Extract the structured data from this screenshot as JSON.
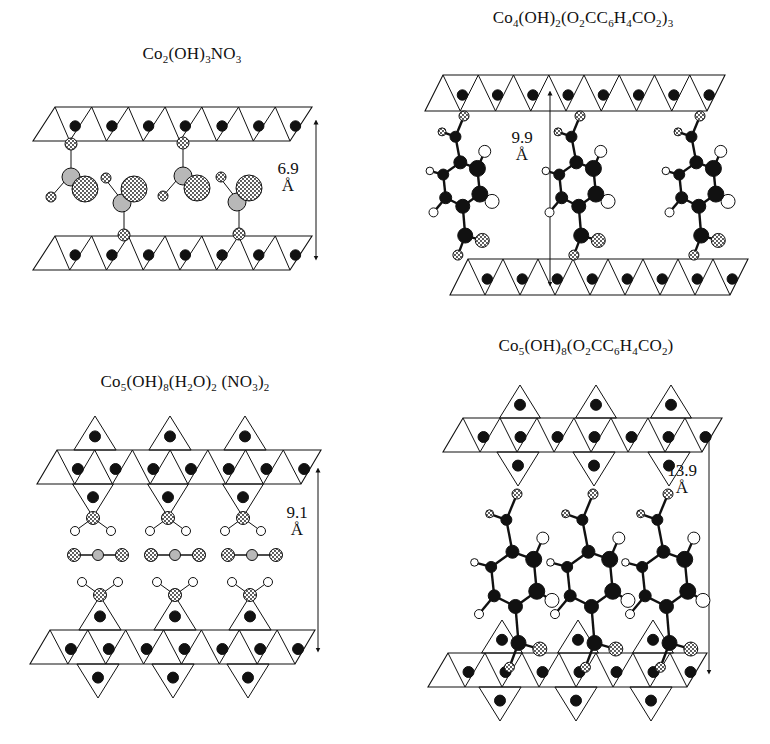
{
  "figure": {
    "panels": [
      {
        "id": "p1",
        "title_parts": [
          [
            "Co",
            ""
          ],
          [
            "2",
            "sub"
          ],
          [
            "(OH)",
            ""
          ],
          [
            "3",
            "sub"
          ],
          [
            "NO",
            ""
          ],
          [
            "3",
            "sub"
          ]
        ],
        "title_text": "Co2(OH)3NO3",
        "title_pos": [
          192,
          58
        ],
        "distance": "6.9",
        "unit": "Å",
        "dist_pos": [
          288,
          168
        ],
        "arrow": {
          "x": 316,
          "y1": 122,
          "y2": 258
        },
        "layer_type": "brucite",
        "layers": [
          {
            "top": 107,
            "bot": 141,
            "xl_top": 55,
            "xr_top": 312,
            "xl_bot": 33,
            "xr_bot": 290,
            "n": 7
          },
          {
            "top": 236,
            "bot": 270,
            "xl_top": 55,
            "xr_top": 312,
            "xl_bot": 33,
            "xr_bot": 290,
            "n": 7
          }
        ],
        "guest": "nitrate-grafted"
      },
      {
        "id": "p2",
        "title_parts": [
          [
            "Co",
            ""
          ],
          [
            "4",
            "sub"
          ],
          [
            "(OH)",
            ""
          ],
          [
            "2",
            "sub"
          ],
          [
            "(O",
            ""
          ],
          [
            "2",
            "sub"
          ],
          [
            "CC",
            ""
          ],
          [
            "6",
            "sub"
          ],
          [
            "H",
            ""
          ],
          [
            "4",
            "sub"
          ],
          [
            "CO",
            ""
          ],
          [
            "2",
            "sub"
          ],
          [
            ")",
            ""
          ],
          [
            "3",
            "sub"
          ]
        ],
        "title_text": "Co4(OH)2(O2CC6H4CO2)3",
        "title_pos": [
          583,
          22
        ],
        "distance": "9.9",
        "unit": "Å",
        "dist_pos": [
          522,
          137
        ],
        "arrow": {
          "x": 550,
          "y1": 93,
          "y2": 284
        },
        "layer_type": "brucite",
        "layers": [
          {
            "top": 75,
            "bot": 111,
            "xl_top": 443,
            "xr_top": 725,
            "xl_bot": 425,
            "xr_bot": 707,
            "n": 8
          },
          {
            "top": 259,
            "bot": 295,
            "xl_top": 468,
            "xr_top": 748,
            "xl_bot": 450,
            "xr_bot": 730,
            "n": 8
          }
        ],
        "guest": "terephthalate-grafted"
      },
      {
        "id": "p3",
        "title_parts": [
          [
            "Co",
            ""
          ],
          [
            "5",
            "sub"
          ],
          [
            "(OH)",
            ""
          ],
          [
            "8",
            "sub"
          ],
          [
            "(H",
            ""
          ],
          [
            "2",
            "sub"
          ],
          [
            "O)",
            ""
          ],
          [
            "2",
            "sub"
          ],
          [
            " (NO",
            ""
          ],
          [
            "3",
            "sub"
          ],
          [
            ")",
            ""
          ],
          [
            "2",
            "sub"
          ]
        ],
        "title_text": "Co5(OH)8(H2O)2 (NO3)2",
        "title_pos": [
          185,
          386
        ],
        "distance": "9.1",
        "unit": "Å",
        "dist_pos": [
          297,
          512
        ],
        "arrow": {
          "x": 318,
          "y1": 470,
          "y2": 650
        },
        "layer_type": "tetra-decorated",
        "layers": [
          {
            "top": 450,
            "bot": 484,
            "xl_top": 57,
            "xr_top": 321,
            "xl_bot": 37,
            "xr_bot": 301,
            "n": 7,
            "up_apex": 416,
            "down_apex": 517,
            "tet_x": [
              95,
              170,
              245
            ]
          },
          {
            "top": 630,
            "bot": 664,
            "xl_top": 50,
            "xr_top": 315,
            "xl_bot": 30,
            "xr_bot": 295,
            "n": 7,
            "up_apex": 596,
            "down_apex": 698,
            "tet_x": [
              100,
              175,
              250
            ]
          }
        ],
        "guest": "water-nitrate"
      },
      {
        "id": "p4",
        "title_parts": [
          [
            "Co",
            ""
          ],
          [
            "5",
            "sub"
          ],
          [
            "(OH)",
            ""
          ],
          [
            "8",
            "sub"
          ],
          [
            "(O",
            ""
          ],
          [
            "2",
            "sub"
          ],
          [
            "CC",
            ""
          ],
          [
            "6",
            "sub"
          ],
          [
            "H",
            ""
          ],
          [
            "4",
            "sub"
          ],
          [
            "CO",
            ""
          ],
          [
            "2",
            "sub"
          ],
          [
            ")",
            ""
          ]
        ],
        "title_text": "Co5(OH)8(O2CC6H4CO2)",
        "title_pos": [
          586,
          350
        ],
        "distance": "13.9",
        "unit": "Å",
        "dist_pos": [
          682,
          470
        ],
        "arrow": {
          "x": 709,
          "y1": 435,
          "y2": 672
        },
        "layer_type": "tetra-decorated",
        "layers": [
          {
            "top": 418,
            "bot": 452,
            "xl_top": 463,
            "xr_top": 722,
            "xl_bot": 443,
            "xr_bot": 702,
            "n": 7,
            "up_apex": 385,
            "down_apex": 486,
            "tet_x": [
              520,
              596,
              671
            ]
          },
          {
            "top": 653,
            "bot": 687,
            "xl_top": 448,
            "xr_top": 707,
            "xl_bot": 428,
            "xr_bot": 687,
            "n": 7,
            "up_apex": 620,
            "down_apex": 721,
            "tet_x": [
              502,
              578,
              653
            ]
          }
        ],
        "guest": "terephthalate-pillared"
      }
    ],
    "colors": {
      "line": "#111111",
      "atom_dark": "#111111",
      "atom_gray": "#b8b8b8",
      "atom_white": "#ffffff",
      "background": "#ffffff"
    }
  }
}
